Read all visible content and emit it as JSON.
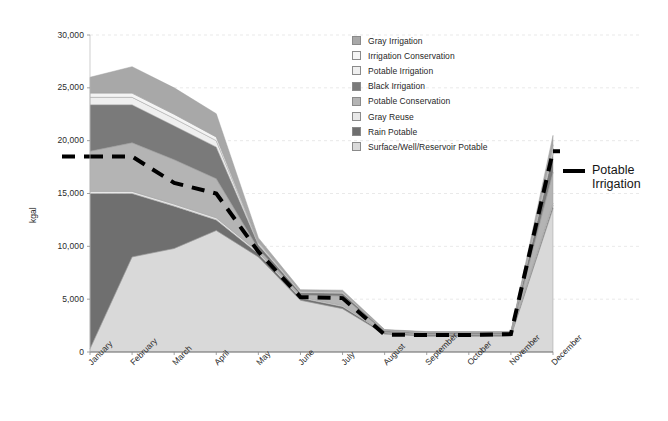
{
  "chart_data": {
    "type": "area",
    "title": "",
    "subtitle": "",
    "xlabel": "",
    "ylabel": "kgal",
    "ylim": [
      0,
      30000
    ],
    "ytick_labels": [
      "30,000",
      "25,000",
      "20,000",
      "15,000",
      "10,000",
      "5,000",
      "0"
    ],
    "ytick_values": [
      30000,
      25000,
      20000,
      15000,
      10000,
      5000,
      0
    ],
    "grid": true,
    "grid_axis": "y",
    "legend_position": "inside-top-center",
    "stacked": true,
    "categories": [
      "January",
      "February",
      "March",
      "April",
      "May",
      "June",
      "July",
      "August",
      "September",
      "October",
      "November",
      "December"
    ],
    "series": [
      {
        "name": "Surface/Well/Reservoir Potable",
        "color": "#d9d9d9",
        "values": [
          300,
          9000,
          9800,
          11500,
          9000,
          4900,
          4100,
          1700,
          1500,
          1500,
          1500,
          13600
        ]
      },
      {
        "name": "Rain Potable",
        "color": "#6f6f6f",
        "values": [
          14700,
          6000,
          4000,
          1000,
          300,
          200,
          200,
          100,
          100,
          100,
          100,
          300
        ]
      },
      {
        "name": "Gray Reuse",
        "color": "#e8e8e8",
        "values": [
          200,
          200,
          200,
          200,
          150,
          100,
          100,
          50,
          50,
          50,
          50,
          200
        ]
      },
      {
        "name": "Potable Conservation",
        "color": "#b4b4b4",
        "values": [
          3800,
          4600,
          4200,
          3700,
          300,
          200,
          900,
          50,
          50,
          50,
          50,
          2900
        ]
      },
      {
        "name": "Black Irrigation",
        "color": "#7a7a7a",
        "values": [
          4400,
          3600,
          3200,
          3000,
          400,
          200,
          250,
          100,
          100,
          100,
          100,
          1800
        ]
      },
      {
        "name": "Potable Irrigation",
        "color": "#efefef",
        "values": [
          700,
          700,
          700,
          600,
          150,
          100,
          100,
          50,
          50,
          50,
          50,
          500
        ]
      },
      {
        "name": "Irrigation Conservation",
        "color": "#f4f4f4",
        "values": [
          400,
          400,
          400,
          350,
          100,
          50,
          50,
          30,
          30,
          30,
          30,
          300
        ]
      },
      {
        "name": "Gray Irrigation",
        "color": "#a8a8a8",
        "values": [
          1500,
          2500,
          2500,
          2200,
          400,
          150,
          150,
          50,
          50,
          50,
          50,
          900
        ]
      }
    ],
    "overlay_line": {
      "name": "Potable Irrigation",
      "style": "dashed",
      "color": "#000000",
      "width": 4,
      "values": [
        18500,
        18500,
        16000,
        15000,
        9500,
        5200,
        5100,
        1650,
        1600,
        1600,
        1700,
        19000
      ]
    },
    "annotation": {
      "label": "Potable\nIrrigation"
    }
  },
  "legend": {
    "items": [
      {
        "label": "Gray Irrigation",
        "color": "#a8a8a8"
      },
      {
        "label": "Irrigation Conservation",
        "color": "#f4f4f4"
      },
      {
        "label": "Potable Irrigation",
        "color": "#efefef"
      },
      {
        "label": "Black Irrigation",
        "color": "#7a7a7a"
      },
      {
        "label": "Potable Conservation",
        "color": "#b4b4b4"
      },
      {
        "label": "Gray Reuse",
        "color": "#e8e8e8"
      },
      {
        "label": "Rain Potable",
        "color": "#6f6f6f"
      },
      {
        "label": "Surface/Well/Reservoir Potable",
        "color": "#d9d9d9"
      }
    ]
  }
}
